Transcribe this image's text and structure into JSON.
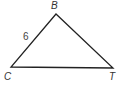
{
  "diagram": {
    "type": "triangle",
    "vertices": [
      {
        "name": "B",
        "x": 56,
        "y": 14,
        "label_x": 51,
        "label_y": 9
      },
      {
        "name": "C",
        "x": 11,
        "y": 67,
        "label_x": 4,
        "label_y": 80
      },
      {
        "name": "T",
        "x": 113,
        "y": 68,
        "label_x": 109,
        "label_y": 80
      }
    ],
    "sides": [
      {
        "from": "C",
        "to": "B",
        "label": "6",
        "label_x": 23,
        "label_y": 40
      }
    ],
    "colors": {
      "stroke": "#222222",
      "label": "#333333"
    }
  }
}
